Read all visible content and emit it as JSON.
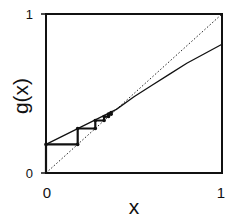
{
  "chart_data": {
    "type": "line",
    "title": "",
    "xlabel": "x",
    "ylabel": "g(x)",
    "xlim": [
      0,
      1
    ],
    "ylim": [
      0,
      1
    ],
    "x_ticks": [
      "0",
      "1"
    ],
    "y_ticks": [
      "0",
      "1"
    ],
    "grid": false,
    "legend": null,
    "series": [
      {
        "name": "g(x)",
        "style": "solid",
        "x": [
          0,
          0.1,
          0.2,
          0.3,
          0.4,
          0.5,
          0.6,
          0.7,
          0.8,
          0.9,
          1.0
        ],
        "y": [
          0.18,
          0.235,
          0.29,
          0.345,
          0.4,
          0.48,
          0.55,
          0.62,
          0.69,
          0.75,
          0.81
        ]
      },
      {
        "name": "y = x",
        "style": "dotted",
        "x": [
          0,
          1
        ],
        "y": [
          0,
          1
        ]
      },
      {
        "name": "cobweb iteration",
        "style": "thick-solid-with-markers",
        "x": [
          0,
          0,
          0.18,
          0.18,
          0.28,
          0.28,
          0.33,
          0.33,
          0.355,
          0.355,
          0.37,
          0.37
        ],
        "y": [
          0,
          0.18,
          0.18,
          0.28,
          0.28,
          0.33,
          0.33,
          0.355,
          0.355,
          0.37,
          0.37,
          0.38
        ]
      }
    ],
    "annotations": []
  },
  "labels": {
    "xlabel": "x",
    "ylabel": "g(x)",
    "x_tick_0": "0",
    "x_tick_1": "1",
    "y_tick_0": "0",
    "y_tick_1": "1"
  }
}
